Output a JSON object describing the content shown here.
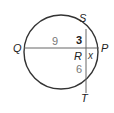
{
  "diagram": {
    "type": "circle-intersecting-chords",
    "points": {
      "Q": "Q",
      "P": "P",
      "S": "S",
      "T": "T",
      "R": "R"
    },
    "segments": {
      "QR": "9",
      "SR": "3",
      "RP": "x",
      "RT": "6"
    },
    "colors": {
      "stroke": "#333333",
      "chord": "#666666",
      "label": "#222222",
      "number_gray": "#777777"
    }
  }
}
